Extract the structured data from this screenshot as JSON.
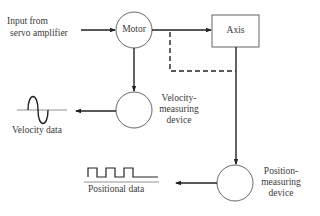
{
  "diagram": {
    "nodes": {
      "input": {
        "label_line1": "Input from",
        "label_line2": "servo amplifier"
      },
      "motor": {
        "label": "Motor"
      },
      "axis": {
        "label": "Axis"
      },
      "velocity_device": {
        "label_line1": "Velocity-",
        "label_line2": "measuring",
        "label_line3": "device"
      },
      "position_device": {
        "label_line1": "Position-",
        "label_line2": "measuring",
        "label_line3": "device"
      },
      "velocity_data": {
        "label": "Velocity data",
        "icon": "sine-wave-icon"
      },
      "positional_data": {
        "label": "Positional data",
        "icon": "square-wave-icon"
      }
    },
    "edges": [
      {
        "from": "input",
        "to": "motor",
        "style": "solid"
      },
      {
        "from": "motor",
        "to": "axis",
        "style": "solid"
      },
      {
        "from": "motor",
        "to": "velocity_device",
        "style": "solid"
      },
      {
        "from": "velocity_device",
        "to": "velocity_data",
        "style": "solid"
      },
      {
        "from": "motor",
        "to": "axis",
        "style": "dashed"
      },
      {
        "from": "axis",
        "to": "position_device",
        "style": "solid"
      },
      {
        "from": "position_device",
        "to": "positional_data",
        "style": "solid"
      }
    ],
    "colors": {
      "stroke": "#333333",
      "text": "#3a3a3a"
    }
  }
}
